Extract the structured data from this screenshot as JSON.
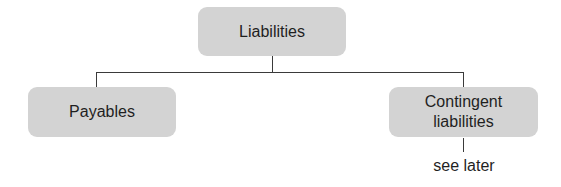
{
  "diagram": {
    "type": "tree",
    "root": {
      "label": "Liabilities"
    },
    "children": [
      {
        "label": "Payables"
      },
      {
        "label": "Contingent\nliabilities",
        "note": "see later"
      }
    ],
    "colors": {
      "node_fill": "#d3d3d3",
      "line": "#3a3a3a",
      "text": "#1f1f1f"
    }
  }
}
